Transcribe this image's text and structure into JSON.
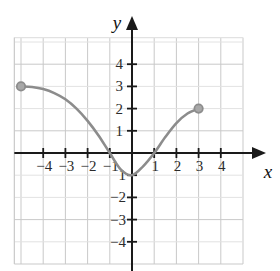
{
  "figure": {
    "title": "",
    "background_color": "#ffffff"
  },
  "axes": {
    "x_label": "x",
    "y_label": "y",
    "x_ticks_negative": [
      "−4",
      "−3",
      "−2",
      "−1"
    ],
    "x_ticks_positive": [
      "1",
      "2",
      "3",
      "4"
    ],
    "y_ticks_positive": [
      "4",
      "3",
      "2",
      "1"
    ],
    "y_ticks_negative": [
      "−1",
      "−2",
      "−3",
      "−4"
    ],
    "axis_color": "#1a1a1a",
    "grid_color": "#c9c9c9",
    "minor_grid_color": "#e2e2e2"
  },
  "chart_data": {
    "type": "line",
    "title": "",
    "xlabel": "x",
    "ylabel": "y",
    "xlim": [
      -5.3,
      5.0
    ],
    "ylim": [
      -5.0,
      5.2
    ],
    "xticks": [
      -4,
      -3,
      -2,
      -1,
      1,
      2,
      3,
      4
    ],
    "yticks": [
      -4,
      -3,
      -2,
      -1,
      1,
      2,
      3,
      4
    ],
    "grid": true,
    "legend": "none",
    "series": [
      {
        "name": "curve",
        "color": "#8c8c8c",
        "line_width": 2.6,
        "x": [
          -5.0,
          -4.5,
          -4.0,
          -3.5,
          -3.0,
          -2.5,
          -2.0,
          -1.5,
          -1.0,
          -0.5,
          0.0,
          0.5,
          1.0,
          1.5,
          2.0,
          2.5,
          3.0
        ],
        "y": [
          3.0,
          2.97,
          2.88,
          2.7,
          2.42,
          2.0,
          1.45,
          0.78,
          0.0,
          -0.75,
          -1.0,
          -0.6,
          0.0,
          0.72,
          1.35,
          1.78,
          2.0
        ]
      }
    ],
    "points": [
      {
        "name": "left-endpoint",
        "x": -5.0,
        "y": 3.0,
        "filled": true,
        "color": "#8c8c8c"
      },
      {
        "name": "right-endpoint",
        "x": 3.0,
        "y": 2.0,
        "filled": true,
        "color": "#8c8c8c"
      }
    ],
    "annotations": [
      {
        "text": "x-intercept",
        "x": -1.0,
        "y": 0.0
      },
      {
        "text": "x-intercept",
        "x": 1.0,
        "y": 0.0
      },
      {
        "text": "minimum",
        "x": 0.0,
        "y": -1.0
      }
    ]
  }
}
